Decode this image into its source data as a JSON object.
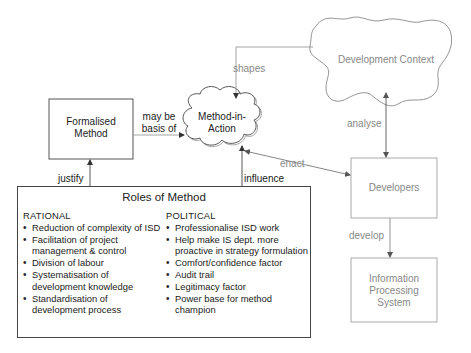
{
  "nodes": {
    "formalised_method": "Formalised\nMethod",
    "formalised_method_line1": "Formalised",
    "formalised_method_line2": "Method",
    "method_in_action_line1": "Method-in-",
    "method_in_action_line2": "Action",
    "development_context": "Development Context",
    "developers": "Developers",
    "ips_line1": "Information",
    "ips_line2": "Processing",
    "ips_line3": "System"
  },
  "edges": {
    "may_be_line1": "may be",
    "may_be_line2": "basis of",
    "shapes": "shapes",
    "analyse": "analyse",
    "enact": "enact",
    "develop": "develop",
    "justify": "justify",
    "influence": "influence"
  },
  "roles": {
    "title": "Roles of Method",
    "rational": {
      "heading": "RATIONAL",
      "items": [
        "Reduction of complexity of ISD",
        "Facilitation of project management & control",
        "Division of labour",
        "Systematisation of development knowledge",
        "Standardisation of development process"
      ]
    },
    "political": {
      "heading": "POLITICAL",
      "items": [
        "Professionalise ISD work",
        "Help make IS dept. more proactive in strategy formulation",
        "Comfort/confidence factor",
        "Audit trail",
        "Legitimacy factor",
        "Power base for method champion"
      ]
    }
  },
  "colors": {
    "dark_line": "#444444",
    "grey_line": "#9a9a9a",
    "dark_text": "#222222",
    "grey_text": "#888888"
  }
}
